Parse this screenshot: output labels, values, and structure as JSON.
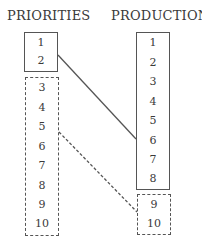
{
  "columns": {
    "priorities": {
      "title": "PRIORITIES",
      "top_group": [
        "1",
        "2"
      ],
      "bottom_group": [
        "3",
        "4",
        "5",
        "6",
        "7",
        "8",
        "9",
        "10"
      ]
    },
    "production": {
      "title": "PRODUCTION",
      "top_group": [
        "1",
        "2",
        "3",
        "4",
        "5",
        "6",
        "7",
        "8"
      ],
      "bottom_group": [
        "9",
        "10"
      ]
    }
  },
  "connectors": [
    {
      "from": "priorities.top_group",
      "to": "production.top_group",
      "style": "solid"
    },
    {
      "from": "priorities.bottom_group",
      "to": "production.bottom_group",
      "style": "dashed"
    }
  ],
  "colors": {
    "line": "#555555",
    "text": "#3a3a3a"
  }
}
